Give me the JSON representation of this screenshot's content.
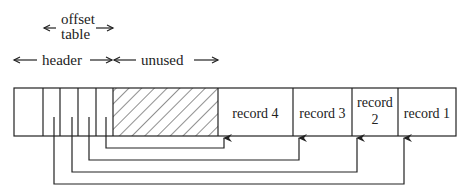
{
  "diagram": {
    "type": "slotted-page-layout",
    "labels": {
      "offset_table_line1": "offset",
      "offset_table_line2": "table",
      "header": "header",
      "unused": "unused"
    },
    "records": [
      {
        "label": "record 4"
      },
      {
        "label": "record 3"
      },
      {
        "label": "record 2",
        "line1": "record",
        "line2": "2"
      },
      {
        "label": "record 1"
      }
    ],
    "regions": [
      "header",
      "offset-table-slots",
      "unused (hatched)",
      "record 4",
      "record 3",
      "record 2",
      "record 1"
    ],
    "pointers": [
      {
        "from": "slot 4",
        "to": "record 4"
      },
      {
        "from": "slot 3",
        "to": "record 3"
      },
      {
        "from": "slot 2",
        "to": "record 2"
      },
      {
        "from": "slot 1",
        "to": "record 1"
      }
    ],
    "colors": {
      "stroke": "#222222",
      "background": "#ffffff"
    }
  }
}
